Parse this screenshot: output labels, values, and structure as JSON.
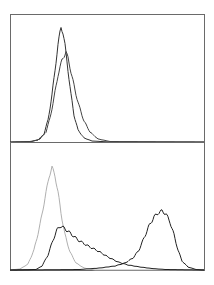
{
  "chart_data": [
    {
      "type": "line",
      "title": "",
      "xlabel": "",
      "ylabel": "",
      "grid": false,
      "legend": null,
      "panel": "top",
      "frame": {
        "x": 10,
        "y": 14,
        "w": 194,
        "h": 128
      },
      "series": [
        {
          "name": "histogram-1",
          "color": "#333333",
          "width": 1.0,
          "points": [
            [
              10,
              142
            ],
            [
              30,
              141.5
            ],
            [
              38,
              140
            ],
            [
              44,
              134
            ],
            [
              48,
              120
            ],
            [
              52,
              95
            ],
            [
              55,
              70
            ],
            [
              58,
              45
            ],
            [
              60,
              32
            ],
            [
              61,
              27
            ],
            [
              63,
              33
            ],
            [
              65,
              45
            ],
            [
              68,
              70
            ],
            [
              71,
              95
            ],
            [
              74,
              115
            ],
            [
              78,
              130
            ],
            [
              84,
              138
            ],
            [
              92,
              141
            ],
            [
              110,
              142
            ],
            [
              204,
              142
            ]
          ]
        },
        {
          "name": "histogram-2",
          "color": "#444444",
          "width": 1.0,
          "points": [
            [
              10,
              142
            ],
            [
              32,
              141.5
            ],
            [
              40,
              139
            ],
            [
              46,
              132
            ],
            [
              50,
              118
            ],
            [
              54,
              98
            ],
            [
              58,
              75
            ],
            [
              62,
              60
            ],
            [
              66,
              52
            ],
            [
              68,
              58
            ],
            [
              71,
              72
            ],
            [
              75,
              90
            ],
            [
              79,
              106
            ],
            [
              84,
              121
            ],
            [
              90,
              132
            ],
            [
              98,
              139
            ],
            [
              110,
              141.5
            ],
            [
              204,
              142
            ]
          ]
        }
      ]
    },
    {
      "type": "line",
      "title": "",
      "xlabel": "",
      "ylabel": "",
      "grid": false,
      "legend": null,
      "panel": "bottom",
      "frame": {
        "x": 10,
        "y": 142,
        "w": 194,
        "h": 128
      },
      "series": [
        {
          "name": "isotype-control",
          "color": "#b0b0b0",
          "width": 1.0,
          "points": [
            [
              10,
              270
            ],
            [
              20,
              269
            ],
            [
              28,
              264
            ],
            [
              34,
              250
            ],
            [
              40,
              225
            ],
            [
              45,
              198
            ],
            [
              49,
              177
            ],
            [
              52,
              167
            ],
            [
              55,
              176
            ],
            [
              58,
              192
            ],
            [
              61,
              213
            ],
            [
              65,
              235
            ],
            [
              70,
              252
            ],
            [
              76,
              263
            ],
            [
              84,
              268
            ],
            [
              95,
              270
            ],
            [
              204,
              270
            ]
          ]
        },
        {
          "name": "sample-broad",
          "color": "#222222",
          "width": 1.0,
          "points": [
            [
              10,
              270
            ],
            [
              36,
              269.5
            ],
            [
              42,
              266
            ],
            [
              48,
              255
            ],
            [
              53,
              240
            ],
            [
              57,
              230
            ],
            [
              60,
              226
            ],
            [
              64,
              228
            ],
            [
              70,
              233
            ],
            [
              78,
              240
            ],
            [
              88,
              246
            ],
            [
              98,
              251
            ],
            [
              108,
              257
            ],
            [
              118,
              262
            ],
            [
              128,
              265
            ],
            [
              140,
              267
            ],
            [
              152,
              268.5
            ],
            [
              165,
              269.5
            ],
            [
              204,
              270
            ]
          ]
        },
        {
          "name": "sample-shifted",
          "color": "#222222",
          "width": 1.0,
          "points": [
            [
              10,
              270
            ],
            [
              80,
              269.5
            ],
            [
              100,
              268
            ],
            [
              115,
              266
            ],
            [
              125,
              263
            ],
            [
              133,
              258
            ],
            [
              139,
              250
            ],
            [
              144,
              238
            ],
            [
              149,
              226
            ],
            [
              154,
              217
            ],
            [
              158,
              213
            ],
            [
              162,
              211
            ],
            [
              166,
              214
            ],
            [
              170,
              222
            ],
            [
              174,
              235
            ],
            [
              178,
              250
            ],
            [
              182,
              261
            ],
            [
              188,
              267
            ],
            [
              196,
              269.5
            ],
            [
              204,
              270
            ]
          ]
        }
      ]
    }
  ]
}
